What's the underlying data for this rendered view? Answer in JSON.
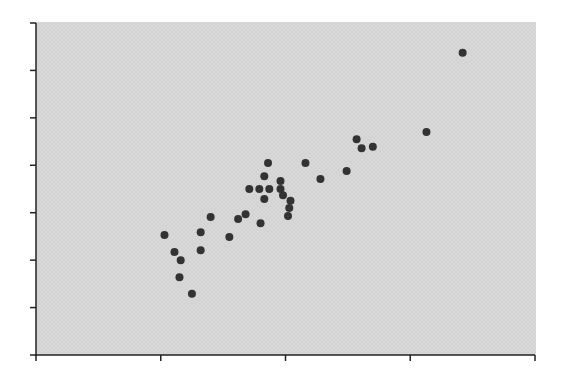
{
  "colors": {
    "background": "#ffffff",
    "plot_area": "#d9d9d9",
    "plot_texture": "#cccccc",
    "axis": "#222222",
    "marker": "#333333"
  },
  "chart_data": {
    "type": "scatter",
    "title": "",
    "xlabel": "",
    "ylabel": "",
    "xlim": [
      0,
      4
    ],
    "ylim": [
      0,
      7
    ],
    "x_ticks": [
      0,
      1,
      2,
      3,
      4
    ],
    "y_ticks": [
      0,
      1,
      2,
      3,
      4,
      5,
      6,
      7
    ],
    "x_tick_labels": [],
    "y_tick_labels": [],
    "grid": false,
    "legend": null,
    "units_note": "no tick labels visible; values expressed in tick-interval units",
    "series": [
      {
        "name": "points",
        "marker": "circle",
        "x": [
          1.03,
          1.11,
          1.16,
          1.15,
          1.25,
          1.32,
          1.32,
          1.4,
          1.55,
          1.62,
          1.68,
          1.71,
          1.79,
          1.87,
          1.8,
          1.83,
          1.83,
          1.86,
          1.96,
          1.96,
          1.98,
          2.04,
          2.03,
          2.02,
          2.16,
          2.28,
          2.49,
          2.57,
          2.61,
          2.7,
          3.13,
          3.42
        ],
        "y": [
          2.53,
          2.17,
          2.0,
          1.64,
          1.29,
          2.59,
          2.21,
          2.91,
          2.49,
          2.87,
          2.97,
          3.5,
          3.5,
          3.5,
          2.78,
          3.77,
          3.29,
          4.05,
          3.5,
          3.67,
          3.37,
          3.25,
          3.1,
          2.93,
          4.05,
          3.71,
          3.88,
          4.55,
          4.36,
          4.39,
          4.7,
          6.37
        ]
      }
    ]
  },
  "layout": {
    "plot_left": 36,
    "plot_top": 22,
    "plot_right": 536,
    "plot_bottom": 355,
    "x_origin_px": 36,
    "x_unit_px": 124.75,
    "y_origin_px": 355,
    "y_unit_px": 47.43,
    "tick_len": 6,
    "marker_radius": 4
  }
}
